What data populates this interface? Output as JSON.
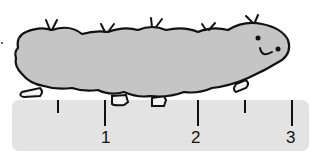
{
  "scene": {
    "description": "Caterpillar resting on a ruler for measuring length",
    "colors": {
      "background": "#ffffff",
      "ruler_fill": "#e3e3e3",
      "caterpillar_fill": "#c5c5c5",
      "outline": "#111111",
      "feet_fill": "#f4f4f4"
    }
  },
  "ruler": {
    "unit_labels": [
      {
        "label": "1",
        "x": 106
      },
      {
        "label": "2",
        "x": 196
      },
      {
        "label": "3",
        "x": 291
      }
    ],
    "major_ticks_x": [
      105,
      198,
      292
    ],
    "minor_ticks_x": [
      58,
      245
    ]
  },
  "caterpillar": {
    "face": {
      "eyes": 2,
      "mouth": "smile"
    },
    "antenna_pairs": 5,
    "feet": 5
  }
}
